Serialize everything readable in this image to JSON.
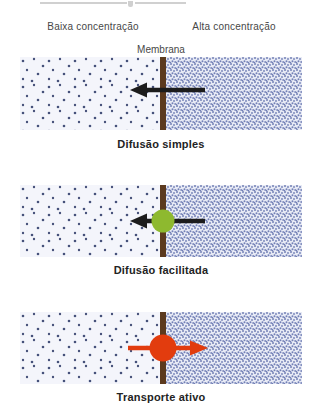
{
  "header": {
    "left_label": "Baixa concentração",
    "right_label": "Alta concentração",
    "membrane_label": "Membrana"
  },
  "panels": [
    {
      "caption": "Difusão simples",
      "arrow_direction": "left",
      "carrier": "none"
    },
    {
      "caption": "Difusão facilitada",
      "arrow_direction": "left",
      "carrier": "carrier-protein-green"
    },
    {
      "caption": "Transporte ativo",
      "arrow_direction": "right",
      "carrier": "pump-protein-red"
    }
  ],
  "colors": {
    "membrane": "#5c3a1e",
    "arrow_black": "#1c1c1c",
    "arrow_red": "#e23c0e",
    "carrier_green": "#8eb92f",
    "pump_red": "#e23c0e",
    "low_concentration_bg": "#f4f5fb",
    "low_concentration_dot": "#46517a",
    "high_concentration_bg": "#e7eaf5",
    "high_concentration_dot": "#7280b6",
    "label_text": "#474747",
    "caption_text": "#232323"
  }
}
